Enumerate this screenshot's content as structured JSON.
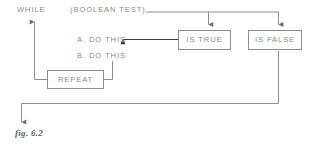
{
  "figure": {
    "caption": "fig. 6.2",
    "line_color": "#8d8d8d",
    "text_color": "#8a8a8a",
    "caption_color": "#5d5d5d",
    "background": "#ffffff"
  },
  "labels": {
    "while_keyword": "WHILE",
    "boolean_test": "(BOOLEAN TEST)",
    "statement_a": "A. DO THIS",
    "statement_b": "B. DO THIS"
  },
  "boxes": {
    "is_true": "IS TRUE",
    "is_false": "IS FALSE",
    "repeat": "REPEAT"
  },
  "connectors": [
    {
      "name": "boolean-test-to-branch-bus",
      "description": "horizontal line from (BOOLEAN TEST) rightwards to the false branch drop"
    },
    {
      "name": "branch-to-is-true",
      "description": "downward arrow into IS TRUE box"
    },
    {
      "name": "branch-to-is-false",
      "description": "downward arrow into IS FALSE box"
    },
    {
      "name": "is-true-to-statement-a",
      "description": "leftward arrow from IS TRUE to A. DO THIS"
    },
    {
      "name": "statements-to-repeat",
      "description": "line from statement block down into right side of REPEAT"
    },
    {
      "name": "repeat-to-while",
      "description": "line from left of REPEAT up to WHILE with upward arrow"
    },
    {
      "name": "is-false-to-exit",
      "description": "line from IS FALSE down, left along the bottom, then down with arrow to exit"
    }
  ]
}
